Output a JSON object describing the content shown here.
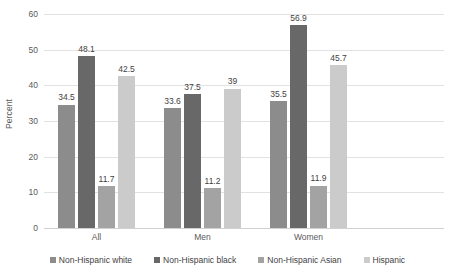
{
  "chart_data": {
    "type": "bar",
    "title": "",
    "xlabel": "",
    "ylabel": "Percent",
    "ylim": [
      0,
      60
    ],
    "yticks": [
      0,
      10,
      20,
      30,
      40,
      50,
      60
    ],
    "ytick_labels": [
      "0",
      "10",
      "20",
      "30",
      "40",
      "50",
      "60"
    ],
    "grid": true,
    "legend_position": "bottom",
    "categories": [
      "All",
      "Men",
      "Women"
    ],
    "series": [
      {
        "name": "Non-Hispanic white",
        "color": "#8c8c8c",
        "values": [
          34.5,
          33.6,
          35.5
        ],
        "labels": [
          "34.5",
          "33.6",
          "35.5"
        ]
      },
      {
        "name": "Non-Hispanic black",
        "color": "#686868",
        "values": [
          48.1,
          37.5,
          56.9
        ],
        "labels": [
          "48.1",
          "37.5",
          "56.9"
        ]
      },
      {
        "name": "Non-Hispanic Asian",
        "color": "#a3a3a3",
        "values": [
          11.7,
          11.2,
          11.9
        ],
        "labels": [
          "11.7",
          "11.2",
          "11.9"
        ]
      },
      {
        "name": "Hispanic",
        "color": "#cbcbcb",
        "values": [
          42.5,
          39,
          45.7
        ],
        "labels": [
          "42.5",
          "39",
          "45.7"
        ]
      }
    ]
  }
}
